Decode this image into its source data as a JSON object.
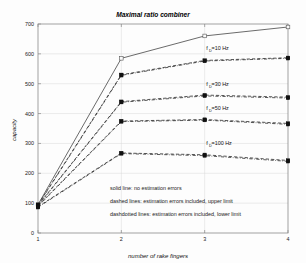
{
  "chart_data": {
    "type": "line",
    "title": "Maximal ratio combiner",
    "xlabel": "number of rake fingers",
    "ylabel": "capacity",
    "x": [
      1,
      2,
      3,
      4
    ],
    "xlim": [
      1,
      4
    ],
    "ylim": [
      0,
      700
    ],
    "xticks": [
      "1",
      "2",
      "3",
      "4"
    ],
    "yticks": [
      "0",
      "100",
      "200",
      "300",
      "400",
      "500",
      "600",
      "700"
    ],
    "grid": true,
    "legend_position": "inside-lower-center-as-text-notes",
    "series": [
      {
        "name": "no estimation errors",
        "style": "solid",
        "marker": "open-square",
        "values": [
          95,
          585,
          660,
          690
        ]
      },
      {
        "name": "f_D=10 Hz upper limit",
        "style": "dashed",
        "marker": "filled-square",
        "values": [
          95,
          530,
          578,
          587
        ]
      },
      {
        "name": "f_D=10 Hz lower limit",
        "style": "dashdot",
        "marker": "filled-square",
        "values": [
          93,
          528,
          576,
          585
        ]
      },
      {
        "name": "f_D=30 Hz upper limit",
        "style": "dashed",
        "marker": "filled-square",
        "values": [
          93,
          440,
          462,
          455
        ]
      },
      {
        "name": "f_D=30 Hz lower limit",
        "style": "dashdot",
        "marker": "filled-square",
        "values": [
          91,
          438,
          459,
          452
        ]
      },
      {
        "name": "f_D=50 Hz upper limit",
        "style": "dashed",
        "marker": "filled-square",
        "values": [
          91,
          375,
          380,
          367
        ]
      },
      {
        "name": "f_D=50 Hz lower limit",
        "style": "dashdot",
        "marker": "filled-square",
        "values": [
          89,
          373,
          378,
          364
        ]
      },
      {
        "name": "f_D=100 Hz upper limit",
        "style": "dashed",
        "marker": "filled-square",
        "values": [
          88,
          268,
          262,
          243
        ]
      },
      {
        "name": "f_D=100 Hz lower limit",
        "style": "dashdot",
        "marker": "filled-square",
        "values": [
          86,
          266,
          259,
          240
        ]
      }
    ],
    "annotations": [
      {
        "id": "fd10",
        "base": "f",
        "sub": "D",
        "rest": "=10 Hz",
        "x": 3.02,
        "y": 612
      },
      {
        "id": "fd30",
        "base": "f",
        "sub": "D",
        "rest": "=30 Hz",
        "x": 3.02,
        "y": 492
      },
      {
        "id": "fd50",
        "base": "f",
        "sub": "D",
        "rest": "=50 Hz",
        "x": 3.02,
        "y": 412
      },
      {
        "id": "fd100",
        "base": "f",
        "sub": "D",
        "rest": "=100 Hz",
        "x": 3.02,
        "y": 295
      }
    ],
    "notes": [
      "solid line: no estimation errors",
      "dashed lines: estimation errors included, upper limit",
      "dashdotted lines: estimation errors included, lower limit"
    ]
  }
}
